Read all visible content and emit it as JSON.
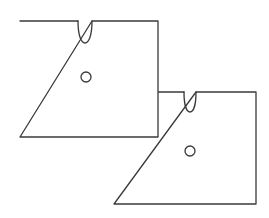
{
  "diagram": {
    "stroke_color": "#3a3a3a",
    "background_color": "#ffffff",
    "cards": [
      {
        "id": "front-card",
        "layer": "front",
        "rect": {
          "x": 20,
          "y": 21,
          "width": 138,
          "height": 116
        },
        "notch": {
          "center_x": 85,
          "top_y": 20,
          "width": 14,
          "depth": 22
        },
        "hole": {
          "cx": 86,
          "cy": 77,
          "r": 5
        }
      },
      {
        "id": "back-card",
        "layer": "back",
        "rect": {
          "x": 114,
          "y": 92,
          "width": 142,
          "height": 112
        },
        "notch": {
          "center_x": 190,
          "top_y": 93,
          "width": 12,
          "depth": 20
        },
        "hole": {
          "cx": 190,
          "cy": 151,
          "r": 5
        }
      }
    ]
  }
}
